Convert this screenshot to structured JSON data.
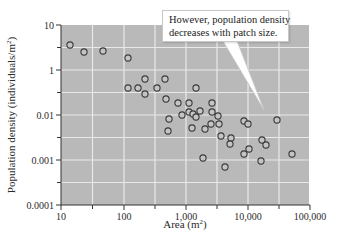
{
  "chart_data": {
    "type": "scatter",
    "title": "",
    "xlabel": "Area (m",
    "xlabel_sup": "2",
    "xlabel_tail": ")",
    "ylabel": "Population density (individuals/m",
    "ylabel_sup": "2",
    "ylabel_tail": ")",
    "x_scale": "log",
    "y_scale": "log",
    "xlim": [
      10,
      100000
    ],
    "ylim_printed": [
      0.0001,
      10
    ],
    "x_ticks": [
      {
        "label": "10",
        "px": 61
      },
      {
        "label": "100",
        "px": 124
      },
      {
        "label": "1,000",
        "px": 186
      },
      {
        "label": "10,000",
        "px": 248
      },
      {
        "label": "100,000",
        "px": 310
      }
    ],
    "y_ticks": [
      {
        "label": "10",
        "px": 25
      },
      {
        "label": "1",
        "px": 70
      },
      {
        "label": "0.01",
        "px": 115
      },
      {
        "label": "0.001",
        "px": 160
      },
      {
        "label": "0.0001",
        "px": 205
      }
    ],
    "grid": true,
    "legend": null,
    "annotation": {
      "lines": [
        "However, population density",
        "decreases with patch size."
      ],
      "pointer_tip": [
        264,
        110
      ]
    },
    "points": [
      {
        "x": 14,
        "y": 3.6,
        "px": [
          70,
          45
        ]
      },
      {
        "x": 23,
        "y": 2.5,
        "px": [
          84,
          52
        ]
      },
      {
        "x": 48,
        "y": 2.6,
        "px": [
          103,
          51
        ]
      },
      {
        "x": 120,
        "y": 1.85,
        "px": [
          128,
          58
        ]
      },
      {
        "x": 120,
        "y": 0.16,
        "px": [
          128,
          88
        ]
      },
      {
        "x": 175,
        "y": 0.16,
        "px": [
          138,
          88
        ]
      },
      {
        "x": 225,
        "y": 0.4,
        "px": [
          145,
          79
        ]
      },
      {
        "x": 225,
        "y": 0.086,
        "px": [
          145,
          94
        ]
      },
      {
        "x": 350,
        "y": 0.16,
        "px": [
          157,
          88
        ]
      },
      {
        "x": 475,
        "y": 0.4,
        "px": [
          165,
          79
        ]
      },
      {
        "x": 500,
        "y": 0.051,
        "px": [
          166,
          99
        ]
      },
      {
        "x": 1500,
        "y": 0.16,
        "px": [
          196,
          88
        ]
      },
      {
        "x": 770,
        "y": 0.034,
        "px": [
          178,
          103
        ]
      },
      {
        "x": 1160,
        "y": 0.034,
        "px": [
          189,
          103
        ]
      },
      {
        "x": 2700,
        "y": 0.034,
        "px": [
          212,
          103
        ]
      },
      {
        "x": 550,
        "y": 0.0081,
        "px": [
          169,
          119
        ]
      },
      {
        "x": 530,
        "y": 0.0044,
        "px": [
          168,
          131
        ]
      },
      {
        "x": 900,
        "y": 0.0095,
        "px": [
          182,
          115
        ]
      },
      {
        "x": 1160,
        "y": 0.0136,
        "px": [
          189,
          112
        ]
      },
      {
        "x": 1350,
        "y": 0.011,
        "px": [
          193,
          114
        ]
      },
      {
        "x": 1500,
        "y": 0.009,
        "px": [
          196,
          117
        ]
      },
      {
        "x": 1750,
        "y": 0.015,
        "px": [
          200,
          111
        ]
      },
      {
        "x": 2700,
        "y": 0.0136,
        "px": [
          212,
          112
        ]
      },
      {
        "x": 3400,
        "y": 0.0095,
        "px": [
          218,
          116
        ]
      },
      {
        "x": 1300,
        "y": 0.0051,
        "px": [
          192,
          128
        ]
      },
      {
        "x": 2100,
        "y": 0.0049,
        "px": [
          205,
          129
        ]
      },
      {
        "x": 2600,
        "y": 0.0063,
        "px": [
          211,
          124
        ]
      },
      {
        "x": 3500,
        "y": 0.0063,
        "px": [
          219,
          124
        ]
      },
      {
        "x": 3800,
        "y": 0.0034,
        "px": [
          221,
          136
        ]
      },
      {
        "x": 5500,
        "y": 0.0031,
        "px": [
          231,
          138
        ]
      },
      {
        "x": 5300,
        "y": 0.0023,
        "px": [
          230,
          144
        ]
      },
      {
        "x": 9000,
        "y": 0.0074,
        "px": [
          244,
          121
        ]
      },
      {
        "x": 10400,
        "y": 0.0063,
        "px": [
          248,
          124
        ]
      },
      {
        "x": 30000,
        "y": 0.0077,
        "px": [
          277,
          120
        ]
      },
      {
        "x": 17500,
        "y": 0.0028,
        "px": [
          262,
          140
        ]
      },
      {
        "x": 20000,
        "y": 0.0022,
        "px": [
          266,
          145
        ]
      },
      {
        "x": 10800,
        "y": 0.0018,
        "px": [
          249,
          149
        ]
      },
      {
        "x": 9000,
        "y": 0.0014,
        "px": [
          244,
          154
        ]
      },
      {
        "x": 1950,
        "y": 0.0011,
        "px": [
          203,
          158
        ]
      },
      {
        "x": 4400,
        "y": 0.0007,
        "px": [
          225,
          167
        ]
      },
      {
        "x": 16800,
        "y": 0.00095,
        "px": [
          261,
          161
        ]
      },
      {
        "x": 53000,
        "y": 0.0014,
        "px": [
          292,
          154
        ]
      }
    ],
    "colors": {
      "plot_background": "#b9b9b9",
      "gridline": "#e9e9e9",
      "marker_stroke": "#3a3a3a",
      "marker_fill": "#c4c4c4",
      "axis": "#333333",
      "text": "#2b2b2b"
    }
  }
}
